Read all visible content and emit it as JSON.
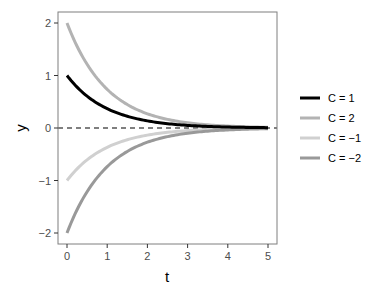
{
  "chart_data": {
    "type": "line",
    "title": "",
    "xlabel": "t",
    "ylabel": "y",
    "xlim": [
      -0.25,
      5.25
    ],
    "ylim": [
      -2.2,
      2.2
    ],
    "x_ticks": [
      0,
      1,
      2,
      3,
      4,
      5
    ],
    "x_tick_labels": [
      "0",
      "1",
      "2",
      "3",
      "4",
      "5"
    ],
    "y_ticks": [
      -2,
      -1,
      0,
      1,
      2
    ],
    "y_tick_labels": [
      "−2",
      "−1",
      "0",
      "1",
      "2"
    ],
    "grid": false,
    "legend_position": "right",
    "function": "y = C * exp(-t)",
    "x": [
      0,
      0.5,
      1,
      1.5,
      2,
      2.5,
      3,
      3.5,
      4,
      4.5,
      5
    ],
    "series": [
      {
        "name": "C = 1",
        "color": "#000000",
        "values": [
          1.0,
          0.607,
          0.368,
          0.223,
          0.135,
          0.082,
          0.05,
          0.03,
          0.018,
          0.011,
          0.007
        ]
      },
      {
        "name": "C = 2",
        "color": "#b3b3b3",
        "values": [
          2.0,
          1.213,
          0.736,
          0.446,
          0.271,
          0.164,
          0.1,
          0.06,
          0.037,
          0.022,
          0.013
        ]
      },
      {
        "name": "C = −1",
        "color": "#d0d0d0",
        "values": [
          -1.0,
          -0.607,
          -0.368,
          -0.223,
          -0.135,
          -0.082,
          -0.05,
          -0.03,
          -0.018,
          -0.011,
          -0.007
        ]
      },
      {
        "name": "C = −2",
        "color": "#999999",
        "values": [
          -2.0,
          -1.213,
          -0.736,
          -0.446,
          -0.271,
          -0.164,
          -0.1,
          -0.06,
          -0.037,
          -0.022,
          -0.013
        ]
      }
    ],
    "annotations": [
      {
        "type": "hline",
        "y": 0,
        "style": "dashed",
        "color": "#000000"
      }
    ]
  }
}
